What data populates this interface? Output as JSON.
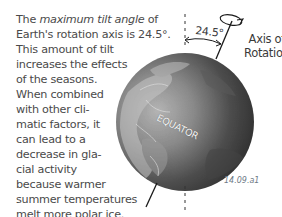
{
  "caption": {
    "lines": [
      {
        "pre": "The ",
        "em": "maximum tilt angle",
        "post": " of"
      },
      {
        "text": "Earth's rotation axis is 24.5°."
      },
      {
        "text": "This amount of tilt"
      },
      {
        "text": "increases the effects"
      },
      {
        "text": "of the seasons."
      },
      {
        "text": "When combined"
      },
      {
        "text": "with other cli-"
      },
      {
        "text": "matic factors, it"
      },
      {
        "text": "can lead to a"
      },
      {
        "text": "decrease in gla-"
      },
      {
        "text": "cial activity"
      },
      {
        "text": "because warmer"
      },
      {
        "text": "summer temperatures"
      },
      {
        "text": "melt more polar ice."
      }
    ]
  },
  "diagram": {
    "tilt_angle_label": "24.5°",
    "axis_label_line1": "Axis of",
    "axis_label_line2": "Rotation",
    "equator_label": "EQUATOR",
    "figure_id": "14.09.a1",
    "icons": {
      "globe": "earth-globe-icon",
      "rotation": "rotation-arrow-icon",
      "vertical_reference": "dashed-vertical-line",
      "tilted_axis": "tilted-axis-line",
      "angle_arc": "angle-arc-arrow"
    },
    "colors": {
      "globe_dark": "#3a3a3a",
      "globe_light": "#a8a8a8",
      "line": "#1a1a1a",
      "text": "#4a4a4a",
      "figure_id": "#6e7a86"
    }
  }
}
